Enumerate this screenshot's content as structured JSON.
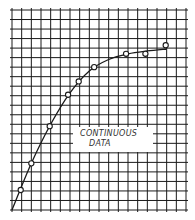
{
  "chart_data": {
    "type": "line",
    "title": "",
    "xlabel": "",
    "ylabel": "",
    "grid": true,
    "annotation": [
      "CONTINUOUS",
      "DATA"
    ],
    "grid_cols": 18,
    "grid_rows": 21,
    "xlim": [
      0,
      18
    ],
    "ylim": [
      0,
      21
    ],
    "points": [
      {
        "x": 0.9,
        "y": 2.1
      },
      {
        "x": 2.0,
        "y": 4.9
      },
      {
        "x": 3.9,
        "y": 8.8
      },
      {
        "x": 5.8,
        "y": 12.1
      },
      {
        "x": 6.9,
        "y": 13.5
      },
      {
        "x": 8.5,
        "y": 15.0
      },
      {
        "x": 11.8,
        "y": 16.4
      },
      {
        "x": 13.8,
        "y": 16.4
      },
      {
        "x": 15.9,
        "y": 17.3
      }
    ],
    "curve": [
      {
        "x": 0,
        "y": 0
      },
      {
        "x": 2,
        "y": 4.9
      },
      {
        "x": 4,
        "y": 9.0
      },
      {
        "x": 6,
        "y": 12.3
      },
      {
        "x": 8,
        "y": 14.6
      },
      {
        "x": 10,
        "y": 15.8
      },
      {
        "x": 12,
        "y": 16.4
      },
      {
        "x": 14,
        "y": 16.7
      },
      {
        "x": 16,
        "y": 16.9
      }
    ]
  },
  "colors": {
    "grid": "#1a1a1a",
    "curve": "#1a1a1a",
    "background": "#ffffff"
  }
}
